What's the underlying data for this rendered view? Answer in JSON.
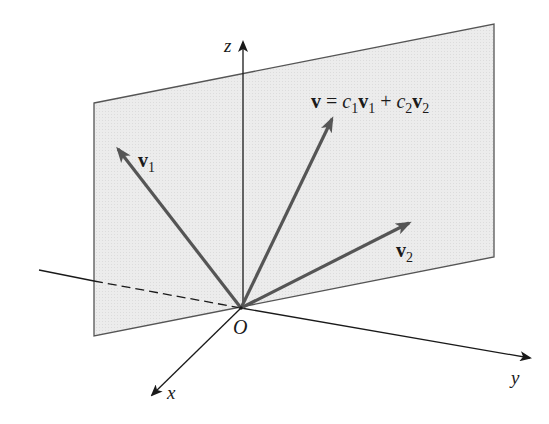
{
  "diagram": {
    "title": "",
    "colors": {
      "background": "#ffffff",
      "plane_fill": "#ebebeb",
      "plane_edge": "#555555",
      "axis": "#1a1a1a",
      "vector": "#555555",
      "text": "#1a1a1a"
    },
    "axes": {
      "x_label": "x",
      "y_label": "y",
      "z_label": "z",
      "origin_label": "O"
    },
    "plane": {
      "description": "plane spanned by v1 and v2 through origin"
    },
    "vectors": {
      "v1": {
        "symbol": "v",
        "subscript": "1"
      },
      "v2": {
        "symbol": "v",
        "subscript": "2"
      },
      "v": {
        "symbol": "v",
        "equals": "=",
        "c1": "c",
        "c1_sub": "1",
        "v1": "v",
        "v1_sub": "1",
        "plus": "+",
        "c2": "c",
        "c2_sub": "2",
        "v2": "v",
        "v2_sub": "2"
      }
    }
  }
}
